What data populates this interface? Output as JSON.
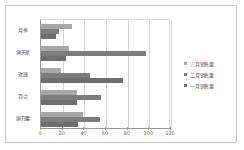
{
  "chart_data": {
    "type": "bar",
    "orientation": "horizontal",
    "title": "",
    "xlabel": "",
    "ylabel": "",
    "xlim": [
      0,
      120
    ],
    "xticks": [
      0,
      20,
      40,
      60,
      80,
      100,
      120
    ],
    "grid": true,
    "legend_position": "right",
    "categories": [
      "月季",
      "满天星",
      "玫瑰",
      "百合",
      "康乃馨"
    ],
    "series": [
      {
        "name": "三月销售量",
        "color": "#a8a8a8",
        "values": [
          29,
          26,
          18,
          33,
          39
        ]
      },
      {
        "name": "二月销售量",
        "color": "#7d7d7d",
        "values": [
          17,
          97,
          45,
          55,
          54
        ]
      },
      {
        "name": "一月销售量",
        "color": "#6e6e6e",
        "values": [
          14,
          23,
          76,
          33,
          34
        ]
      }
    ]
  },
  "legend": {
    "items": [
      {
        "label": "三月销售量",
        "series": "s3"
      },
      {
        "label": "二月销售量",
        "series": "s2"
      },
      {
        "label": "一月销售量",
        "series": "s1"
      }
    ]
  }
}
